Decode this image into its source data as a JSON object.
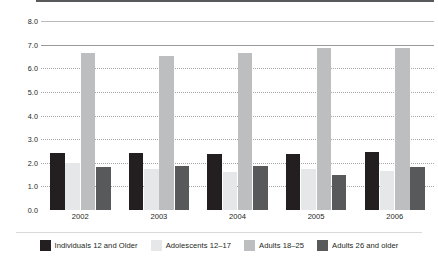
{
  "chart_data": {
    "type": "bar",
    "title": "",
    "subtitle": "",
    "xlabel": "",
    "ylabel": "",
    "categories": [
      "2002",
      "2003",
      "2004",
      "2005",
      "2006"
    ],
    "ylim": [
      0.0,
      8.0
    ],
    "ytick_step": 1.0,
    "ytick_labels": [
      "8.0",
      "7.0",
      "6.0",
      "5.0",
      "4.0",
      "3.0",
      "2.0",
      "1.0",
      "0.0"
    ],
    "ytick_values": [
      8.0,
      7.0,
      6.0,
      5.0,
      4.0,
      3.0,
      2.0,
      1.0,
      0.0
    ],
    "grid": true,
    "grid_axis": "y",
    "legend_position": "bottom",
    "series": [
      {
        "name": "Individuals 12 and Older",
        "color": "#231f20",
        "values": [
          2.4,
          2.4,
          2.35,
          2.35,
          2.45
        ]
      },
      {
        "name": "Adolescents 12–17",
        "color": "#e6e7e8",
        "values": [
          2.0,
          1.75,
          1.6,
          1.75,
          1.65
        ]
      },
      {
        "name": "Adults 18–25",
        "color": "#bcbec0",
        "values": [
          6.65,
          6.5,
          6.65,
          6.85,
          6.85
        ]
      },
      {
        "name": "Adults 26 and older",
        "color": "#58595b",
        "values": [
          1.8,
          1.85,
          1.85,
          1.5,
          1.8
        ]
      }
    ]
  },
  "legend": {
    "items": [
      {
        "label": "Individuals 12 and Older"
      },
      {
        "label": "Adolescents 12–17"
      },
      {
        "label": "Adults 18–25"
      },
      {
        "label": "Adults 26 and older"
      }
    ]
  }
}
